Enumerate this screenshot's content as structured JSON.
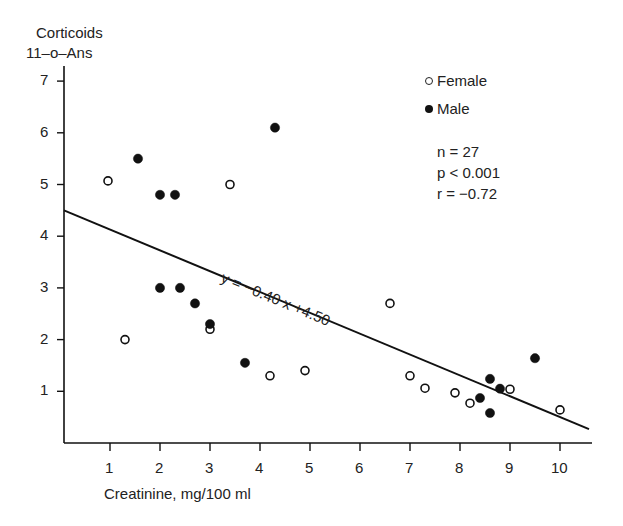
{
  "chart_data": {
    "type": "scatter",
    "title": "",
    "ylabel_line1": "Corticoids",
    "ylabel_line2": "11–o–Ans",
    "xlabel": "Creatinine, mg/100 ml",
    "x_ticks": [
      1,
      2,
      3,
      4,
      5,
      6,
      7,
      8,
      9,
      10
    ],
    "y_ticks": [
      1,
      2,
      3,
      4,
      5,
      6,
      7
    ],
    "xlim": [
      0,
      10.65
    ],
    "ylim": [
      0,
      7.4
    ],
    "grid": false,
    "legend_position": "top-right",
    "series": [
      {
        "name": "Female",
        "marker": "open-circle",
        "points": [
          [
            0.96,
            5.07
          ],
          [
            1.3,
            2.0
          ],
          [
            3.0,
            2.2
          ],
          [
            3.4,
            5.0
          ],
          [
            4.2,
            1.3
          ],
          [
            4.9,
            1.4
          ],
          [
            6.6,
            2.7
          ],
          [
            7.0,
            1.3
          ],
          [
            7.3,
            1.06
          ],
          [
            7.9,
            0.97
          ],
          [
            8.2,
            0.77
          ],
          [
            9.0,
            1.04
          ],
          [
            10.0,
            0.64
          ]
        ]
      },
      {
        "name": "Male",
        "marker": "filled-circle",
        "points": [
          [
            1.56,
            5.5
          ],
          [
            2.0,
            4.8
          ],
          [
            2.3,
            4.8
          ],
          [
            4.3,
            6.1
          ],
          [
            2.0,
            3.0
          ],
          [
            2.4,
            3.0
          ],
          [
            2.7,
            2.7
          ],
          [
            3.0,
            2.3
          ],
          [
            3.7,
            1.55
          ],
          [
            8.4,
            0.87
          ],
          [
            8.6,
            0.58
          ],
          [
            8.6,
            1.24
          ],
          [
            8.8,
            1.05
          ],
          [
            9.5,
            1.64
          ]
        ]
      }
    ],
    "regression": {
      "label": "y = −0.40 x +4.50",
      "slope": -0.4,
      "intercept": 4.5,
      "x_start": 0,
      "x_end": 10.58
    },
    "stats": {
      "n": "n = 27",
      "p": "p < 0.001",
      "r": "r = −0.72"
    },
    "legend": [
      {
        "label": "Female",
        "marker": "open-circle"
      },
      {
        "label": "Male",
        "marker": "filled-circle"
      }
    ]
  }
}
